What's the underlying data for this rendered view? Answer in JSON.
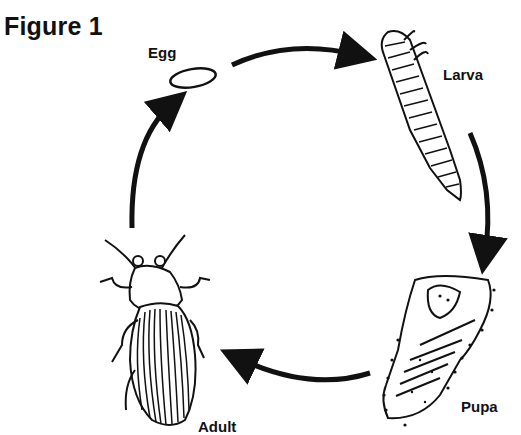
{
  "figure": {
    "title": "Figure 1",
    "type": "life-cycle",
    "stages": [
      {
        "id": "egg",
        "label": "Egg"
      },
      {
        "id": "larva",
        "label": "Larva"
      },
      {
        "id": "pupa",
        "label": "Pupa"
      },
      {
        "id": "adult",
        "label": "Adult"
      }
    ],
    "flow": [
      "egg -> larva",
      "larva -> pupa",
      "pupa -> adult",
      "adult -> egg"
    ],
    "colors": {
      "ink": "#111111",
      "background": "#ffffff"
    }
  }
}
